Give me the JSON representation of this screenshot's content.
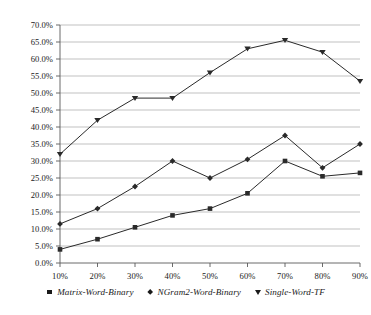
{
  "chart_data": {
    "type": "line",
    "title": "",
    "subtitle": "",
    "xlabel": "",
    "ylabel": "",
    "x": [
      "10%",
      "20%",
      "30%",
      "40%",
      "50%",
      "60%",
      "70%",
      "80%",
      "90%"
    ],
    "x_numeric": [
      10,
      20,
      30,
      40,
      50,
      60,
      70,
      80,
      90
    ],
    "xlim": [
      10,
      90
    ],
    "ylim": [
      0,
      70
    ],
    "ytick_labels": [
      "0.0%",
      "5.0%",
      "10.0%",
      "15.0%",
      "20.0%",
      "25.0%",
      "30.0%",
      "35.0%",
      "40.0%",
      "45.0%",
      "50.0%",
      "55.0%",
      "60.0%",
      "65.0%",
      "70.0%"
    ],
    "ytick_values": [
      0,
      5,
      10,
      15,
      20,
      25,
      30,
      35,
      40,
      45,
      50,
      55,
      60,
      65,
      70
    ],
    "grid": "horizontal",
    "legend_position": "bottom",
    "series": [
      {
        "name": "Matrix-Word-Binary",
        "marker": "square",
        "color": "#2a2a2a",
        "values": [
          4.0,
          7.0,
          10.5,
          14.0,
          16.0,
          20.5,
          30.0,
          25.5,
          26.5
        ]
      },
      {
        "name": "NGram2-Word-Binary",
        "marker": "diamond",
        "color": "#2a2a2a",
        "values": [
          11.5,
          16.0,
          22.5,
          30.0,
          25.0,
          30.5,
          37.5,
          28.0,
          35.0
        ]
      },
      {
        "name": "Single-Word-TF",
        "marker": "triangle-down",
        "color": "#2a2a2a",
        "values": [
          32.0,
          42.0,
          48.5,
          48.5,
          56.0,
          63.0,
          65.5,
          62.0,
          53.5
        ]
      }
    ]
  },
  "legend": {
    "entries": [
      {
        "label": "Matrix-Word-Binary",
        "marker": "square"
      },
      {
        "label": "NGram2-Word-Binary",
        "marker": "diamond"
      },
      {
        "label": "Single-Word-TF",
        "marker": "triangle-down"
      }
    ]
  }
}
